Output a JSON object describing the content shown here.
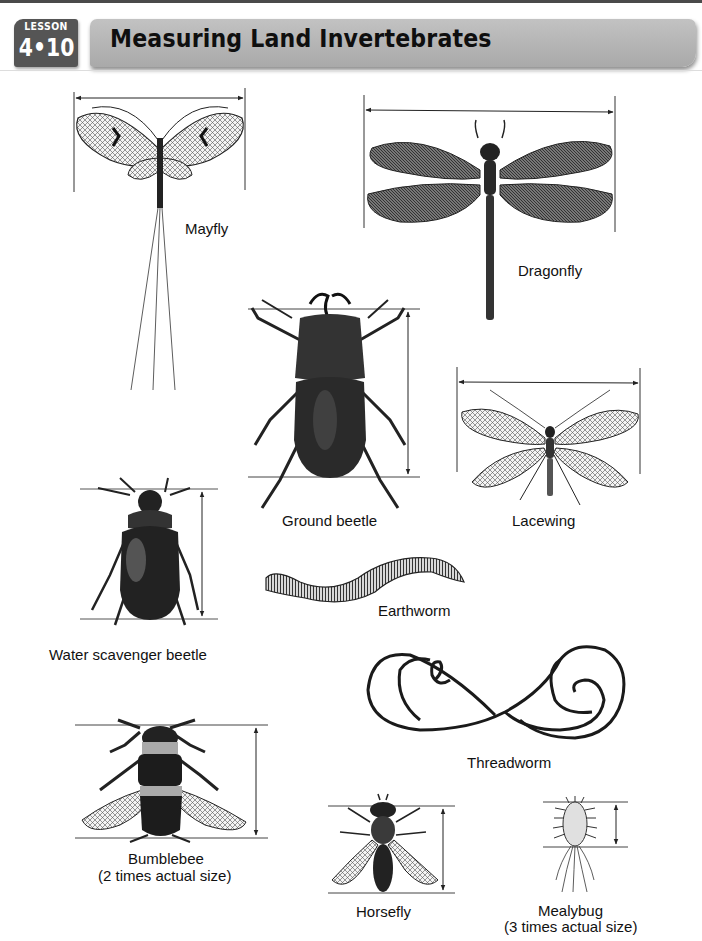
{
  "header": {
    "lesson_word": "LESSON",
    "lesson_number": "4•10",
    "title": "Measuring Land Invertebrates"
  },
  "colors": {
    "badge_bg": "#555555",
    "title_bar_bg": "#b5b5b5",
    "ink": "#1a1a1a"
  },
  "figures": [
    {
      "id": "mayfly",
      "label": "Mayfly",
      "measure": "horizontal wingspan"
    },
    {
      "id": "dragonfly",
      "label": "Dragonfly",
      "measure": "horizontal wingspan"
    },
    {
      "id": "ground-beetle",
      "label": "Ground beetle",
      "measure": "vertical body length"
    },
    {
      "id": "lacewing",
      "label": "Lacewing",
      "measure": "horizontal wingspan"
    },
    {
      "id": "water-scavenger-beetle",
      "label": "Water scavenger beetle",
      "measure": "vertical body length"
    },
    {
      "id": "earthworm",
      "label": "Earthworm",
      "measure": "none"
    },
    {
      "id": "threadworm",
      "label": "Threadworm",
      "measure": "none"
    },
    {
      "id": "bumblebee",
      "label": "Bumblebee",
      "note": "(2 times actual size)",
      "measure": "vertical body length"
    },
    {
      "id": "horsefly",
      "label": "Horsefly",
      "measure": "vertical body length"
    },
    {
      "id": "mealybug",
      "label": "Mealybug",
      "note": "(3 times actual size)",
      "measure": "vertical body length"
    }
  ]
}
